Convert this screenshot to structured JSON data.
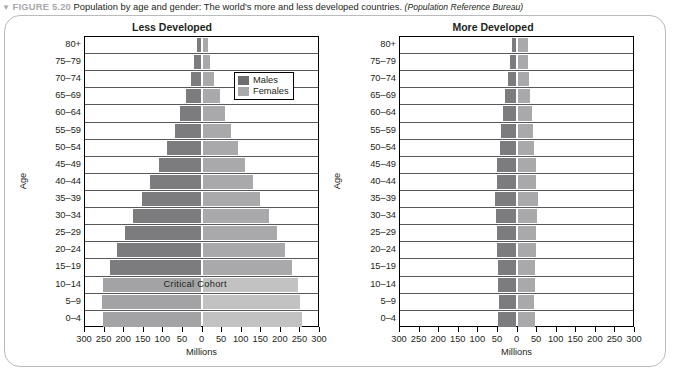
{
  "caption": {
    "marker": "▼",
    "figure_number": "FIGURE 5.20",
    "text": "Population by age and gender: The world's more and less developed countries.",
    "source": "(Population Reference Bureau)"
  },
  "legend": {
    "males_label": "Males",
    "females_label": "Females",
    "males_color": "#6e6e70",
    "females_color": "#a9a9ab"
  },
  "axes": {
    "y_title": "Age",
    "x_title": "Millions",
    "x_ticks": [
      "300",
      "250",
      "200",
      "150",
      "100",
      "50",
      "0",
      "50",
      "100",
      "150",
      "200",
      "250",
      "300"
    ],
    "age_groups": [
      "80+",
      "75–79",
      "70–74",
      "65–69",
      "60–64",
      "55–59",
      "50–54",
      "45–49",
      "40–44",
      "35–39",
      "30–34",
      "25–29",
      "20–24",
      "15–19",
      "10–14",
      "5–9",
      "0–4"
    ]
  },
  "annotations": {
    "critical_cohort": "Critical  Cohort"
  },
  "chart_data": [
    {
      "type": "bar",
      "title": "Less Developed",
      "orientation": "population-pyramid",
      "xlabel": "Millions",
      "ylabel": "Age",
      "xlim": [
        -300,
        300
      ],
      "grid": true,
      "legend_position": "top-right",
      "categories": [
        "80+",
        "75–79",
        "70–74",
        "65–69",
        "60–64",
        "55–59",
        "50–54",
        "45–49",
        "40–44",
        "35–39",
        "30–34",
        "25–29",
        "20–24",
        "15–19",
        "10–14",
        "5–9",
        "0–4"
      ],
      "series": [
        {
          "name": "Males",
          "side": "left",
          "values": [
            10,
            16,
            25,
            38,
            52,
            66,
            86,
            106,
            128,
            150,
            172,
            194,
            214,
            232,
            248,
            252,
            250
          ]
        },
        {
          "name": "Females",
          "side": "right",
          "values": [
            14,
            20,
            30,
            44,
            58,
            72,
            90,
            108,
            128,
            148,
            170,
            190,
            210,
            228,
            244,
            250,
            255
          ]
        }
      ],
      "highlighted_categories": [
        "10–14",
        "5–9",
        "0–4"
      ],
      "annotation": "Critical  Cohort"
    },
    {
      "type": "bar",
      "title": "More Developed",
      "orientation": "population-pyramid",
      "xlabel": "Millions",
      "ylabel": "Age",
      "xlim": [
        -300,
        300
      ],
      "grid": true,
      "legend_position": "top-right",
      "categories": [
        "80+",
        "75–79",
        "70–74",
        "65–69",
        "60–64",
        "55–59",
        "50–54",
        "45–49",
        "40–44",
        "35–39",
        "30–34",
        "25–29",
        "20–24",
        "15–19",
        "10–14",
        "5–9",
        "0–4"
      ],
      "series": [
        {
          "name": "Males",
          "side": "left",
          "values": [
            10,
            14,
            20,
            26,
            32,
            38,
            40,
            46,
            48,
            52,
            50,
            48,
            46,
            44,
            44,
            42,
            44
          ]
        },
        {
          "name": "Females",
          "side": "right",
          "values": [
            28,
            26,
            30,
            32,
            36,
            40,
            42,
            46,
            48,
            52,
            50,
            48,
            46,
            44,
            44,
            42,
            44
          ]
        }
      ]
    }
  ]
}
